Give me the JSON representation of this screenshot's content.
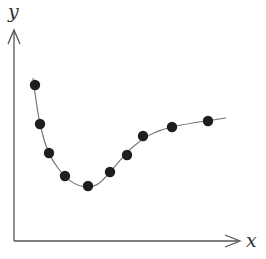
{
  "chart_data": {
    "type": "scatter",
    "title": "",
    "xlabel": "x",
    "ylabel": "y",
    "grid": false,
    "legend": null,
    "ticks": {
      "x": [],
      "y": []
    },
    "annotations": [
      "smooth fitted curve through data points"
    ],
    "points": [
      {
        "x": 35,
        "y": 85
      },
      {
        "x": 40,
        "y": 124
      },
      {
        "x": 49,
        "y": 153
      },
      {
        "x": 65,
        "y": 176
      },
      {
        "x": 88,
        "y": 186
      },
      {
        "x": 110,
        "y": 172
      },
      {
        "x": 127,
        "y": 155
      },
      {
        "x": 143,
        "y": 136
      },
      {
        "x": 172,
        "y": 127
      },
      {
        "x": 208,
        "y": 121
      }
    ],
    "values_normalized": [
      {
        "x": 0.1,
        "y": 0.74
      },
      {
        "x": 0.12,
        "y": 0.56
      },
      {
        "x": 0.16,
        "y": 0.42
      },
      {
        "x": 0.23,
        "y": 0.31
      },
      {
        "x": 0.33,
        "y": 0.26
      },
      {
        "x": 0.43,
        "y": 0.33
      },
      {
        "x": 0.5,
        "y": 0.41
      },
      {
        "x": 0.57,
        "y": 0.5
      },
      {
        "x": 0.7,
        "y": 0.54
      },
      {
        "x": 0.86,
        "y": 0.57
      }
    ]
  },
  "axes": {
    "x_label": "x",
    "y_label": "y"
  },
  "colors": {
    "axis": "#555555",
    "curve": "#777777",
    "point": "#1e1e1e"
  }
}
